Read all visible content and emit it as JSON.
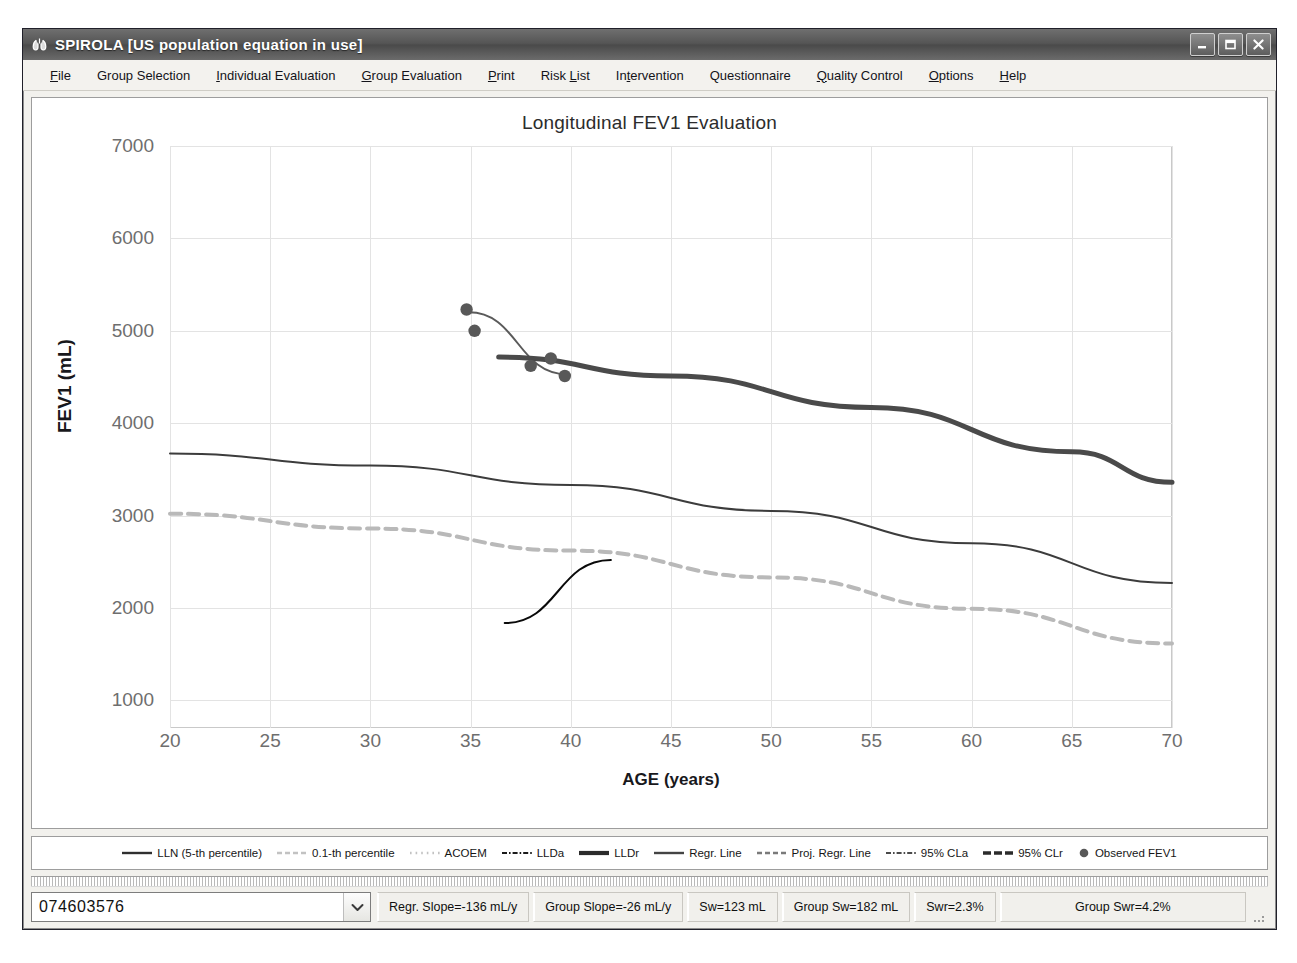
{
  "window": {
    "title": "SPIROLA  [US population equation in use]",
    "icon": "app-lung-icon",
    "buttons": [
      {
        "name": "minimize-button",
        "label": "Minimize"
      },
      {
        "name": "maximize-button",
        "label": "Maximize"
      },
      {
        "name": "close-button",
        "label": "Close"
      }
    ]
  },
  "menubar": {
    "items": [
      {
        "label": "File",
        "mnemonic": "F"
      },
      {
        "label": "Group Selection",
        "mnemonic": ""
      },
      {
        "label": "Individual Evaluation",
        "mnemonic": "I"
      },
      {
        "label": "Group Evaluation",
        "mnemonic": "G"
      },
      {
        "label": "Print",
        "mnemonic": "P"
      },
      {
        "label": "Risk List",
        "mnemonic": "L"
      },
      {
        "label": "Intervention",
        "mnemonic": "t"
      },
      {
        "label": "Questionnaire",
        "mnemonic": ""
      },
      {
        "label": "Quality Control",
        "mnemonic": "Q"
      },
      {
        "label": "Options",
        "mnemonic": "O"
      },
      {
        "label": "Help",
        "mnemonic": "H"
      }
    ]
  },
  "chart_data": {
    "type": "scatter",
    "title": "Longitudinal FEV1 Evaluation",
    "xlabel": "AGE (years)",
    "ylabel": "FEV1 (mL)",
    "xlim": [
      20,
      70
    ],
    "ylim": [
      700,
      7000
    ],
    "xticks": [
      20,
      25,
      30,
      35,
      40,
      45,
      50,
      55,
      60,
      65,
      70
    ],
    "yticks": [
      1000,
      2000,
      3000,
      4000,
      5000,
      6000,
      7000
    ],
    "grid": true,
    "legend_position": "bottom",
    "points": {
      "name": "Observed FEV1",
      "color": "#585858",
      "x": [
        34.8,
        35.2,
        38.0,
        39.0,
        39.7
      ],
      "y": [
        5230,
        5000,
        4620,
        4700,
        4510
      ]
    },
    "series": [
      {
        "name": "LLN (5-th percentile)",
        "style": "solid",
        "color": "#3c3c3c",
        "width": 2,
        "x": [
          20,
          30,
          40,
          50,
          60,
          70
        ],
        "y": [
          3670,
          3540,
          3330,
          3050,
          2700,
          2270
        ]
      },
      {
        "name": "0.1-th percentile",
        "style": "dashed",
        "color": "#b9b9b9",
        "width": 4,
        "x": [
          20,
          30,
          40,
          50,
          60,
          70
        ],
        "y": [
          3020,
          2860,
          2620,
          2330,
          1990,
          1615
        ]
      },
      {
        "name": "Regr. Line",
        "style": "solid",
        "color": "#5a5a5a",
        "width": 2,
        "x": [
          34.9,
          39.8
        ],
        "y": [
          5200,
          4530
        ]
      },
      {
        "name": "LLDr",
        "style": "solid-thick",
        "color": "#4a4a4a",
        "width": 5,
        "x": [
          36.4,
          45,
          55,
          65,
          70
        ],
        "y": [
          4715,
          4510,
          4170,
          3690,
          3360
        ]
      },
      {
        "name": "LLDa",
        "style": "solid-black",
        "color": "#0a0a0a",
        "width": 2,
        "x": [
          36.7,
          42.0
        ],
        "y": [
          1835,
          2520
        ]
      }
    ],
    "legend": [
      {
        "label": "LLN (5-th percentile)",
        "style": "solid",
        "color": "#2f2f2f",
        "width": 2.4
      },
      {
        "label": "0.1-th percentile",
        "style": "dashed",
        "color": "#c2c2c2",
        "width": 2.6
      },
      {
        "label": "ACOEM",
        "style": "dotted",
        "color": "#c2c2c2",
        "width": 2.6
      },
      {
        "label": "LLDa",
        "style": "dashdot",
        "color": "#1a1a1a",
        "width": 2.2
      },
      {
        "label": "LLDr",
        "style": "solid",
        "color": "#2b2b2b",
        "width": 4.2
      },
      {
        "label": "Regr. Line",
        "style": "solid",
        "color": "#444444",
        "width": 2.4
      },
      {
        "label": "Proj. Regr. Line",
        "style": "dashed",
        "color": "#7a7a7a",
        "width": 2.4
      },
      {
        "label": "95% CLa",
        "style": "dashdot",
        "color": "#4a4a4a",
        "width": 2.0
      },
      {
        "label": "95% CLr",
        "style": "longdash",
        "color": "#2b2b2b",
        "width": 3.4
      },
      {
        "label": "Observed FEV1",
        "style": "marker",
        "color": "#585858",
        "width": 0
      }
    ]
  },
  "statusbar": {
    "subject_id": "074603576",
    "dropdown_icon": "chevron-down-icon",
    "cells": [
      "Regr. Slope=-136 mL/y",
      "Group Slope=-26 mL/y",
      "Sw=123 mL",
      "Group Sw=182 mL",
      "Swr=2.3%",
      "Group Swr=4.2%"
    ]
  }
}
